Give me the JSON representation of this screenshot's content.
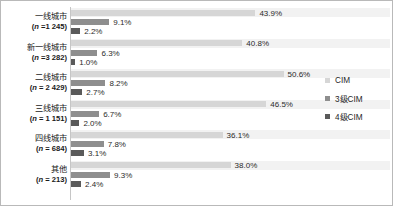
{
  "chart_data": {
    "type": "bar",
    "orientation": "horizontal",
    "title": "",
    "xlabel": "",
    "ylabel": "",
    "grid": false,
    "legend_position": "right",
    "xlim": [
      0,
      60
    ],
    "value_suffix": "%",
    "categories": [
      "一线城市",
      "新一线城市",
      "二线城市",
      "三线城市",
      "四线城市",
      "其他"
    ],
    "category_sublabels": [
      "(n =1 245)",
      "(n =3 282)",
      "(n = 2 429)",
      "(n = 1 151)",
      "(n = 684)",
      "(n = 213)"
    ],
    "category_n": [
      1245,
      3282,
      2429,
      1151,
      684,
      213
    ],
    "series": [
      {
        "name": "CIM",
        "color": "#d6d6d6",
        "values": [
          43.9,
          40.8,
          50.6,
          46.5,
          36.1,
          38.0
        ],
        "labels": [
          "43.9%",
          "40.8%",
          "50.6%",
          "46.5%",
          "36.1%",
          "38.0%"
        ]
      },
      {
        "name": "3级CIM",
        "color": "#8e8e8e",
        "values": [
          9.1,
          6.3,
          8.2,
          6.7,
          7.8,
          9.3
        ],
        "labels": [
          "9.1%",
          "6.3%",
          "8.2%",
          "6.7%",
          "7.8%",
          "9.3%"
        ]
      },
      {
        "name": "4级CIM",
        "color": "#5a5a5a",
        "values": [
          2.2,
          1.0,
          2.7,
          2.0,
          3.1,
          2.4
        ],
        "labels": [
          "2.2%",
          "1.0%",
          "2.7%",
          "2.0%",
          "3.1%",
          "2.4%"
        ]
      }
    ]
  },
  "legend": {
    "items": [
      {
        "label": "CIM",
        "color": "#d6d6d6"
      },
      {
        "label": "3级CIM",
        "color": "#8e8e8e"
      },
      {
        "label": "4级CIM",
        "color": "#5a5a5a"
      }
    ]
  },
  "colors": {
    "series_cim": "#d6d6d6",
    "series_cim3": "#8e8e8e",
    "series_cim4": "#5a5a5a",
    "band": "#f2f2f2",
    "axis": "#c6c6c6",
    "border": "#b9b9b9",
    "text": "#1a1a1a"
  }
}
